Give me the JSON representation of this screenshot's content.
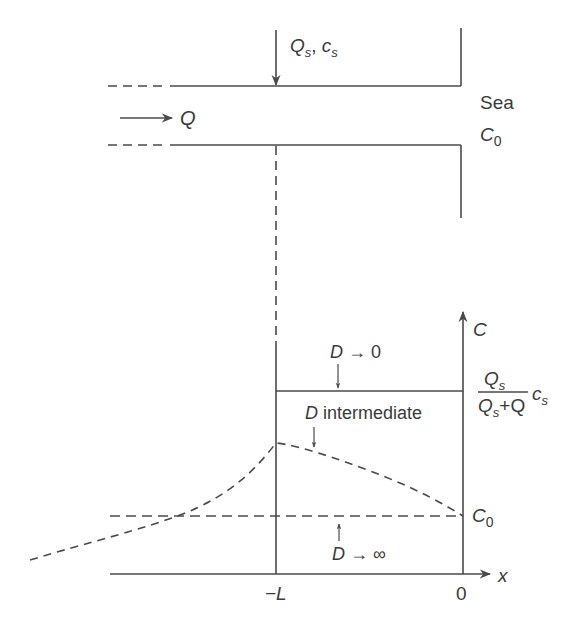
{
  "diagram": {
    "title": "",
    "channel": {
      "inflow_label": "Q",
      "source_label_Q": "Q",
      "source_sub_Q": "s",
      "source_sep": ", ",
      "source_label_c": "c",
      "source_sub_c": "s",
      "sea_label": "Sea",
      "sea_conc_label": "C",
      "sea_conc_sub": "0"
    },
    "plot": {
      "y_axis_label": "C",
      "x_axis_label": "x",
      "x_tick_left": "−L",
      "x_tick_right": "0",
      "level_high": {
        "num_Q": "Q",
        "num_sub": "s",
        "den_Q1": "Q",
        "den_sub": "s",
        "den_rest": "+Q",
        "factor_c": "c",
        "factor_sub": "s"
      },
      "level_low": {
        "label": "C",
        "sub": "0"
      },
      "curves": {
        "d_zero": {
          "D": "D",
          "rest": " → 0"
        },
        "d_intermediate": {
          "D": "D",
          "rest": " intermediate"
        },
        "d_infinity": {
          "D": "D",
          "rest": " → ∞"
        }
      }
    },
    "colors": {
      "line": "#4a4a4a",
      "text": "#3a3a3a",
      "background": "#ffffff"
    }
  }
}
